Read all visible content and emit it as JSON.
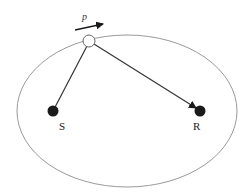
{
  "diagram": {
    "ellipse": {
      "cx": 127,
      "cy": 111,
      "rx": 110,
      "ry": 76,
      "stroke": "#9a9a9a"
    },
    "nodes": [
      {
        "id": "S",
        "label": "S",
        "x": 53,
        "y": 111,
        "filled": true
      },
      {
        "id": "R",
        "label": "R",
        "x": 200,
        "y": 111,
        "filled": true
      },
      {
        "id": "P",
        "label": "",
        "x": 89,
        "y": 41,
        "filled": false
      }
    ],
    "edges": [
      {
        "from": "P",
        "to": "S",
        "arrow": false
      },
      {
        "from": "P",
        "to": "R",
        "arrow": true
      }
    ],
    "velocity": {
      "label": "p",
      "x1": 75,
      "y1": 30,
      "x2": 103,
      "y2": 24
    },
    "colors": {
      "line": "#333333",
      "node_fill": "#1a1a1a",
      "ellipse": "#9a9a9a"
    }
  }
}
